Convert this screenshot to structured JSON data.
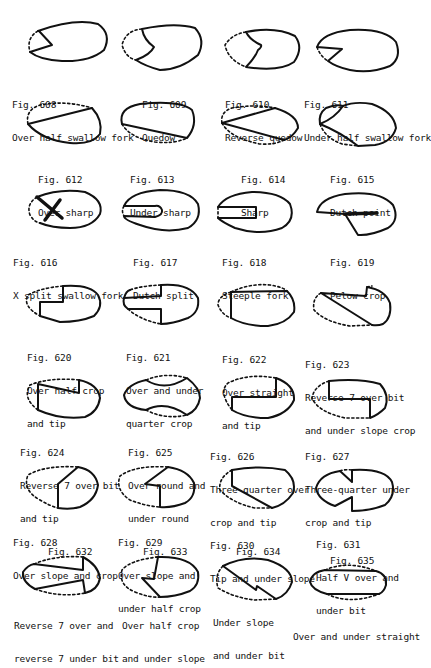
{
  "figures": [
    {
      "num": "Fig. 608",
      "lines": [
        "Over half swallow fork"
      ]
    },
    {
      "num": "Fig. 609",
      "lines": [
        "Quedow"
      ]
    },
    {
      "num": "Fig. 610",
      "lines": [
        "Reverse quedow"
      ]
    },
    {
      "num": "Fig. 611",
      "lines": [
        "Under half swallow fork"
      ]
    },
    {
      "num": "Fig. 612",
      "lines": [
        "Over sharp"
      ]
    },
    {
      "num": "Fig. 613",
      "lines": [
        "Under sharp"
      ]
    },
    {
      "num": "Fig. 614",
      "lines": [
        "Sharp"
      ]
    },
    {
      "num": "Fig. 615",
      "lines": [
        "Dutch point"
      ]
    },
    {
      "num": "Fig. 616",
      "lines": [
        "X split swallow fork"
      ]
    },
    {
      "num": "Fig. 617",
      "lines": [
        "Dutch split"
      ]
    },
    {
      "num": "Fig. 618",
      "lines": [
        "Steeple fork"
      ]
    },
    {
      "num": "Fig. 619",
      "lines": [
        "Pelow crop"
      ]
    },
    {
      "num": "Fig. 620",
      "lines": [
        "Over half crop",
        "and tip"
      ]
    },
    {
      "num": "Fig. 621",
      "lines": [
        "Over and under",
        "quarter crop"
      ]
    },
    {
      "num": "Fig. 622",
      "lines": [
        "Over straight",
        "and tip"
      ]
    },
    {
      "num": "Fig. 623",
      "lines": [
        "Reverse 7 over bit",
        "and under slope crop"
      ]
    },
    {
      "num": "Fig. 624",
      "lines": [
        "Reverse 7 over bit",
        "and tip"
      ]
    },
    {
      "num": "Fig. 625",
      "lines": [
        "Over round and",
        "under round"
      ]
    },
    {
      "num": "Fig. 626",
      "lines": [
        "Three-quarter over",
        "crop and tip"
      ]
    },
    {
      "num": "Fig. 627",
      "lines": [
        "Three-quarter under",
        "crop and tip"
      ]
    },
    {
      "num": "Fig. 628",
      "lines": [
        "Over slope and crop"
      ]
    },
    {
      "num": "Fig. 629",
      "lines": [
        "Over slope and",
        "under half crop"
      ]
    },
    {
      "num": "Fig. 630",
      "lines": [
        "Tip and under slope"
      ]
    },
    {
      "num": "Fig. 631",
      "lines": [
        "Half V over and",
        "under bit"
      ]
    },
    {
      "num": "Fig. 632",
      "lines": [
        "Reverse 7 over and",
        "reverse 7 under bit"
      ]
    },
    {
      "num": "Fig. 633",
      "lines": [
        "Over half crop",
        "and under slope"
      ]
    },
    {
      "num": "Fig. 634",
      "lines": [
        "Under slope",
        "and under bit"
      ]
    },
    {
      "num": "Fig. 635",
      "lines": [
        "Over and under straight"
      ]
    }
  ]
}
